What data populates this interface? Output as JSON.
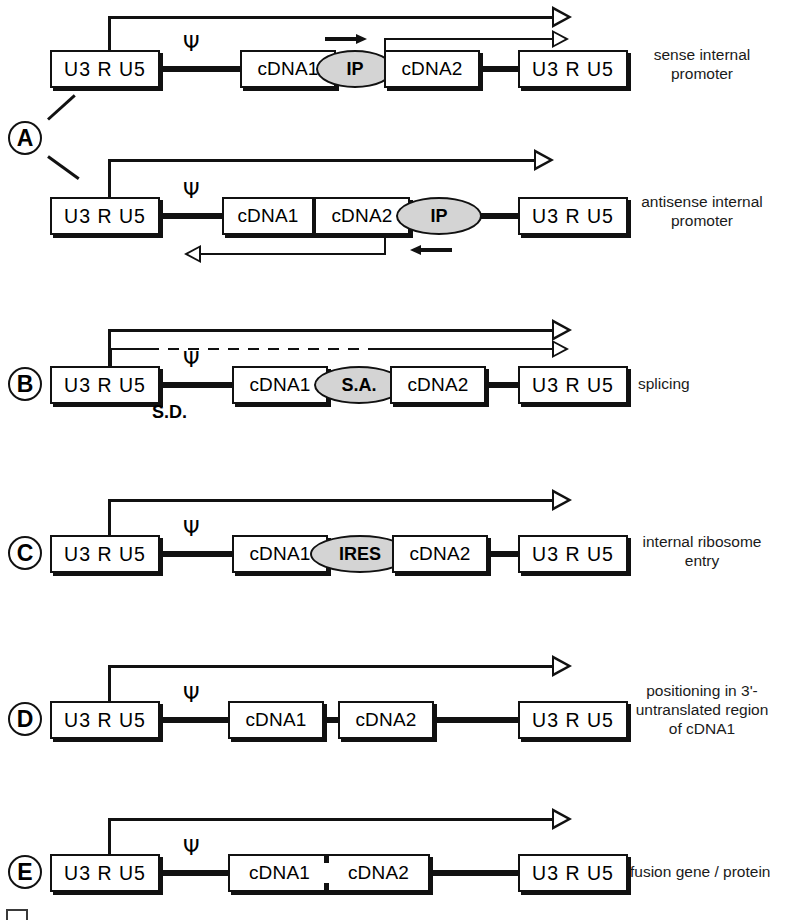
{
  "figure": {
    "ltr_label": "U3 R U5",
    "psi_symbol": "Ψ",
    "panels": [
      {
        "letter": "A",
        "caption": "sense internal promoter",
        "rows": [
          {
            "id": "a-sense",
            "name": "sense-internal-promoter",
            "elements": [
              "U3 R U5",
              "cDNA1",
              "IP",
              "cDNA2",
              "U3 R U5"
            ],
            "internal_element": "IP",
            "internal_element_orientation": "sense",
            "transcripts": [
              "full-length genomic transcript from 5' LTR",
              "internal transcript from IP"
            ]
          },
          {
            "id": "a-antisense",
            "name": "antisense-internal-promoter",
            "elements": [
              "U3 R U5",
              "cDNA1",
              "cDNA2",
              "IP",
              "U3 R U5"
            ],
            "internal_element": "IP",
            "internal_element_orientation": "antisense",
            "transcripts": [
              "full-length genomic transcript from 5' LTR",
              "antisense transcript from IP"
            ]
          }
        ]
      },
      {
        "letter": "B",
        "caption": "splicing",
        "rows": [
          {
            "id": "b-splicing",
            "name": "splicing",
            "elements": [
              "U3 R U5",
              "cDNA1",
              "S.A.",
              "cDNA2",
              "U3 R U5"
            ],
            "internal_element": "S.A.",
            "splice_donor_label": "S.D.",
            "transcripts": [
              "unspliced full-length transcript",
              "spliced transcript"
            ]
          }
        ]
      },
      {
        "letter": "C",
        "caption": "internal ribosome entry",
        "rows": [
          {
            "id": "c-ires",
            "name": "internal-ribosome-entry",
            "elements": [
              "U3 R U5",
              "cDNA1",
              "IRES",
              "cDNA2",
              "U3 R U5"
            ],
            "internal_element": "IRES",
            "transcripts": [
              "full-length bicistronic transcript"
            ]
          }
        ]
      },
      {
        "letter": "D",
        "caption": "positioning in 3'-untranslated region of cDNA1",
        "caption_lines": [
          "positioning in 3'-",
          "untranslated region",
          "of cDNA1"
        ],
        "rows": [
          {
            "id": "d-utr",
            "name": "positioning-in-3prime-utr",
            "elements": [
              "U3 R U5",
              "cDNA1",
              "cDNA2",
              "U3 R U5"
            ],
            "transcripts": [
              "full-length transcript"
            ]
          }
        ]
      },
      {
        "letter": "E",
        "caption": "fusion gene / protein",
        "rows": [
          {
            "id": "e-fusion",
            "name": "fusion-gene-protein",
            "elements": [
              "U3 R U5",
              "cDNA1-cDNA2 fusion",
              "U3 R U5"
            ],
            "fusion_parts": [
              "cDNA1",
              "cDNA2"
            ],
            "transcripts": [
              "full-length transcript"
            ]
          }
        ]
      }
    ],
    "labels": {
      "ltr": "U3 R U5",
      "cdna1": "cDNA1",
      "cdna2": "cDNA2",
      "ip": "IP",
      "sa": "S.A.",
      "sd": "S.D.",
      "ires": "IRES"
    },
    "captions": {
      "a": "sense internal promoter",
      "a_line1": "sense internal",
      "a_line2": "promoter",
      "a2_line1": "antisense internal",
      "a2_line2": "promoter",
      "b": "splicing",
      "c_line1": "internal ribosome",
      "c_line2": "entry",
      "d_line1": "positioning in 3'-",
      "d_line2": "untranslated region",
      "d_line3": "of cDNA1",
      "e": "fusion gene / protein"
    },
    "colors": {
      "ink": "#111111",
      "oval_fill": "#d4d4d4",
      "box_fill": "#ffffff",
      "page": "#ffffff"
    }
  }
}
